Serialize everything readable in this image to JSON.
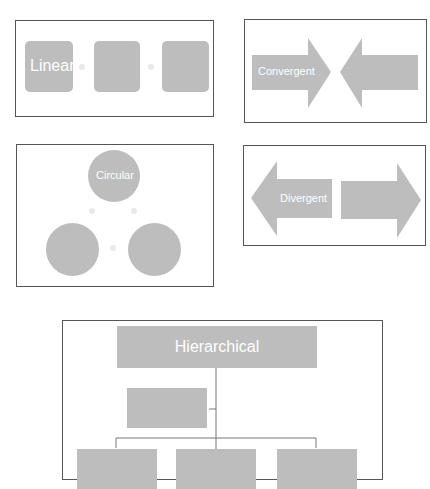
{
  "colors": {
    "shape_fill": "#bdbdbd",
    "border": "#555555",
    "label": "#ffffff",
    "connector": "#777777"
  },
  "panels": {
    "linear": {
      "label": "Linear",
      "items": 3
    },
    "convergent": {
      "label": "Convergent",
      "items": 2
    },
    "circular": {
      "label": "Circular",
      "items": 3
    },
    "divergent": {
      "label": "Divergent",
      "items": 2
    },
    "hierarchical": {
      "label": "Hierarchical",
      "levels": 3,
      "children_bottom": 3
    }
  }
}
